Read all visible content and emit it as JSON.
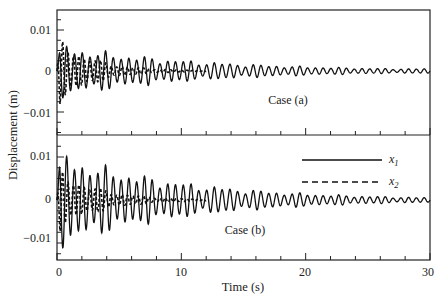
{
  "chart_data": {
    "type": "line",
    "layout": "two vertically stacked panels sharing x-axis",
    "xlabel": "Time (s)",
    "ylabel": "Displacement (m)",
    "xlim": [
      0,
      30
    ],
    "ylim": [
      -0.015,
      0.015
    ],
    "x_ticks": [
      0,
      10,
      20,
      30
    ],
    "x_tick_labels": [
      "0",
      "10",
      "20",
      "30"
    ],
    "x_minor_step": 2,
    "y_ticks": [
      -0.01,
      0,
      0.01
    ],
    "y_tick_labels": [
      "-0.01",
      "0",
      "0.01"
    ],
    "y_minor_step": 0.0025,
    "grid": false,
    "legend": {
      "position": "upper right of lower panel",
      "entries": [
        {
          "label": "x",
          "subscript": "1",
          "style": "solid"
        },
        {
          "label": "x",
          "subscript": "2",
          "style": "dashed"
        }
      ]
    },
    "panels": [
      {
        "label": "Case (a)",
        "series": [
          {
            "name": "x1",
            "style": "solid",
            "peak_amplitude": 0.007,
            "decay_rate": 0.09,
            "frequency_hz": 1.6,
            "final_amplitude_at_30s": 0.0006
          },
          {
            "name": "x2",
            "style": "dashed",
            "peak_amplitude": 0.009,
            "decay_rate": 0.35,
            "frequency_hz": 2.3,
            "final_amplitude_at_30s": 0.0
          }
        ]
      },
      {
        "label": "Case (b)",
        "series": [
          {
            "name": "x1",
            "style": "solid",
            "peak_amplitude": 0.012,
            "decay_rate": 0.1,
            "frequency_hz": 1.6,
            "final_amplitude_at_30s": 0.0006
          },
          {
            "name": "x2",
            "style": "dashed",
            "peak_amplitude": 0.008,
            "decay_rate": 0.3,
            "frequency_hz": 2.3,
            "final_amplitude_at_30s": 0.0
          }
        ]
      }
    ]
  },
  "labels": {
    "xlabel": "Time (s)",
    "ylabel": "Displacement (m)",
    "case_a": "Case (a)",
    "case_b": "Case (b)",
    "legend_x1": "x",
    "legend_x1_sub": "1",
    "legend_x2": "x",
    "legend_x2_sub": "2",
    "x_tick_0": "0",
    "x_tick_10": "10",
    "x_tick_20": "20",
    "x_tick_30": "30",
    "y_pos": "0.01",
    "y_zero": "0",
    "y_neg": "−0.01"
  },
  "colors": {
    "line": "#111111",
    "background": "#ffffff"
  }
}
